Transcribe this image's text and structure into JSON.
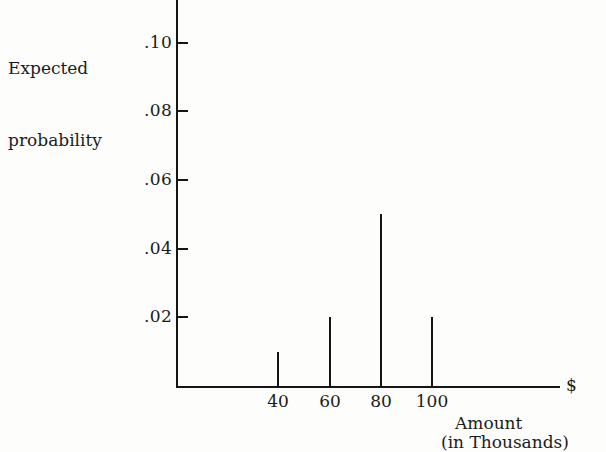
{
  "chart_data": {
    "type": "bar",
    "title": "",
    "subtitle": "",
    "ylabel_line1": "Expected",
    "ylabel_line2": "probability",
    "xlabel_currency": "$",
    "xlabel_line1": "Amount",
    "xlabel_line2": "(in Thousands)",
    "x_unit_note": "in Thousands",
    "categories": [
      "40",
      "60",
      "80",
      "100"
    ],
    "x": [
      40,
      60,
      80,
      100
    ],
    "values": [
      0.01,
      0.02,
      0.05,
      0.02
    ],
    "value_labels": [
      ".01",
      ".02",
      ".05",
      ".02"
    ],
    "ytick_labels": [
      ".10",
      ".08",
      ".06",
      ".04",
      ".02"
    ],
    "ytick_values": [
      0.1,
      0.08,
      0.06,
      0.04,
      0.02
    ],
    "xtick_labels": [
      "40",
      "60",
      "80",
      "100"
    ],
    "ylim": [
      0,
      0.11
    ],
    "xlim": [
      0,
      160
    ],
    "grid": false,
    "legend": false,
    "legend_position": "none",
    "line_color": "#151515",
    "background_color": "#fdfdfc"
  },
  "axes": {
    "y_axis_name": "Expected probability",
    "x_axis_name": "Amount (in Thousands) $"
  },
  "geometry": {
    "origin_x": 176,
    "origin_y": 386,
    "x_axis_end": 560,
    "y_axis_top": 0,
    "pixels_per_unit": 3435,
    "spike_x": [
      278,
      330,
      381,
      432
    ],
    "ytick_y": [
      42,
      111,
      179,
      248,
      317
    ]
  }
}
